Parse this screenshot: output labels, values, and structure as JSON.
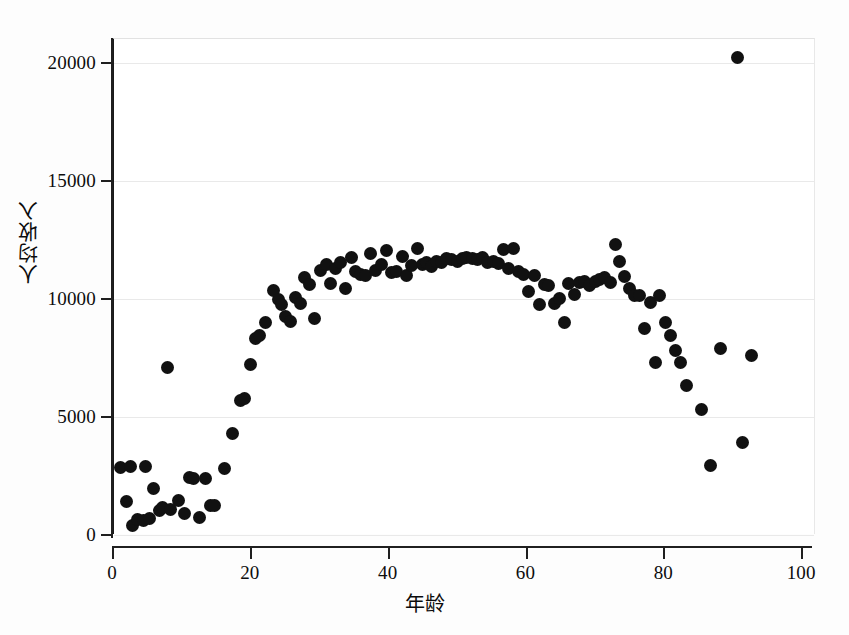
{
  "chart_data": {
    "type": "scatter",
    "title": "",
    "xlabel": "年龄",
    "ylabel": "人均收入",
    "xlim": [
      0,
      102
    ],
    "ylim": [
      0,
      21000
    ],
    "xticks": [
      0,
      20,
      40,
      60,
      80,
      100
    ],
    "yticks": [
      0,
      5000,
      10000,
      15000,
      20000
    ],
    "xtick_labels": [
      "0",
      "20",
      "40",
      "60",
      "80",
      "100"
    ],
    "ytick_labels": [
      "0",
      "5000",
      "10000",
      "15000",
      "20000"
    ],
    "grid": true,
    "grid_axis": "y",
    "legend": false,
    "marker": "filled-circle",
    "marker_color": "#111111",
    "marker_size": 13,
    "background_color": "#ffffff",
    "gridline_color": "#e9e9e9",
    "axis_color": "#1f1f1f",
    "series": [
      {
        "name": "人均收入",
        "points": [
          [
            1.0,
            2850
          ],
          [
            1.8,
            1400
          ],
          [
            2.4,
            2880
          ],
          [
            2.7,
            420
          ],
          [
            3.4,
            650
          ],
          [
            4.3,
            620
          ],
          [
            4.6,
            2880
          ],
          [
            5.2,
            700
          ],
          [
            5.8,
            1950
          ],
          [
            6.6,
            1050
          ],
          [
            7.0,
            1150
          ],
          [
            7.7,
            7100
          ],
          [
            8.2,
            1080
          ],
          [
            9.3,
            1450
          ],
          [
            10.2,
            900
          ],
          [
            11.0,
            2450
          ],
          [
            11.6,
            2400
          ],
          [
            12.4,
            720
          ],
          [
            13.3,
            2400
          ],
          [
            14.0,
            1270
          ],
          [
            14.6,
            1250
          ],
          [
            16.0,
            2800
          ],
          [
            17.2,
            4300
          ],
          [
            18.4,
            5700
          ],
          [
            18.9,
            5800
          ],
          [
            19.8,
            7200
          ],
          [
            20.6,
            8300
          ],
          [
            21.1,
            8450
          ],
          [
            22.0,
            9000
          ],
          [
            23.2,
            10350
          ],
          [
            23.8,
            9950
          ],
          [
            24.3,
            9750
          ],
          [
            24.9,
            9250
          ],
          [
            25.6,
            9050
          ],
          [
            26.4,
            10050
          ],
          [
            27.0,
            9800
          ],
          [
            27.7,
            10900
          ],
          [
            28.3,
            10600
          ],
          [
            29.1,
            9150
          ],
          [
            30.0,
            11200
          ],
          [
            30.8,
            11450
          ],
          [
            31.4,
            10650
          ],
          [
            32.2,
            11300
          ],
          [
            32.9,
            11550
          ],
          [
            33.6,
            10450
          ],
          [
            34.4,
            11750
          ],
          [
            35.0,
            11150
          ],
          [
            35.8,
            11050
          ],
          [
            36.5,
            11000
          ],
          [
            37.2,
            11900
          ],
          [
            38.0,
            11200
          ],
          [
            38.8,
            11450
          ],
          [
            39.5,
            12050
          ],
          [
            40.3,
            11100
          ],
          [
            41.0,
            11150
          ],
          [
            41.8,
            11800
          ],
          [
            42.4,
            11000
          ],
          [
            43.2,
            11400
          ],
          [
            44.0,
            12150
          ],
          [
            44.7,
            11450
          ],
          [
            45.3,
            11550
          ],
          [
            46.0,
            11350
          ],
          [
            46.8,
            11600
          ],
          [
            47.5,
            11550
          ],
          [
            48.2,
            11700
          ],
          [
            49.0,
            11650
          ],
          [
            49.8,
            11600
          ],
          [
            50.5,
            11700
          ],
          [
            51.2,
            11750
          ],
          [
            52.0,
            11700
          ],
          [
            52.8,
            11650
          ],
          [
            53.5,
            11750
          ],
          [
            54.2,
            11550
          ],
          [
            55.0,
            11600
          ],
          [
            55.8,
            11500
          ],
          [
            56.5,
            12100
          ],
          [
            57.3,
            11300
          ],
          [
            58.0,
            12150
          ],
          [
            58.7,
            11150
          ],
          [
            59.4,
            11050
          ],
          [
            60.2,
            10300
          ],
          [
            61.0,
            11000
          ],
          [
            61.7,
            9750
          ],
          [
            62.4,
            10600
          ],
          [
            63.1,
            10550
          ],
          [
            63.9,
            9800
          ],
          [
            64.6,
            10000
          ],
          [
            65.3,
            9000
          ],
          [
            66.0,
            10650
          ],
          [
            66.8,
            10200
          ],
          [
            67.5,
            10700
          ],
          [
            68.2,
            10750
          ],
          [
            69.0,
            10550
          ],
          [
            69.8,
            10750
          ],
          [
            70.5,
            10800
          ],
          [
            71.2,
            10900
          ],
          [
            72.0,
            10700
          ],
          [
            72.8,
            12300
          ],
          [
            73.4,
            11600
          ],
          [
            74.0,
            10950
          ],
          [
            74.8,
            10450
          ],
          [
            75.5,
            10150
          ],
          [
            76.2,
            10150
          ],
          [
            77.0,
            8750
          ],
          [
            77.8,
            9850
          ],
          [
            78.5,
            7300
          ],
          [
            79.2,
            10150
          ],
          [
            80.0,
            9000
          ],
          [
            80.8,
            8450
          ],
          [
            81.5,
            7800
          ],
          [
            82.2,
            7300
          ],
          [
            83.0,
            6350
          ],
          [
            85.2,
            5300
          ],
          [
            86.5,
            2950
          ],
          [
            88.0,
            7900
          ],
          [
            90.5,
            20200
          ],
          [
            91.2,
            3900
          ],
          [
            92.5,
            7600
          ]
        ]
      }
    ]
  }
}
